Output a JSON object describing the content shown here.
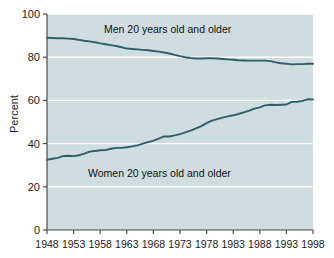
{
  "chart_data": {
    "type": "line",
    "title": "",
    "subtitle": "",
    "xlabel": "",
    "ylabel": "Percent",
    "xlim": [
      1948,
      1998
    ],
    "ylim": [
      0,
      100
    ],
    "grid": true,
    "grid_color": "#ffffff",
    "plot_background": "#cfdde0",
    "line_color": "#2d5f6b",
    "legend_position": "inline-annotation",
    "xticks": [
      1948,
      1953,
      1958,
      1963,
      1968,
      1973,
      1978,
      1983,
      1988,
      1993,
      1998
    ],
    "xtick_labels": [
      "1948",
      "1953",
      "1958",
      "1963",
      "1968",
      "1973",
      "1978",
      "1983",
      "1988",
      "1993",
      "1998"
    ],
    "yticks": [
      0,
      20,
      40,
      60,
      80,
      100
    ],
    "ytick_labels": [
      "0",
      "20",
      "40",
      "60",
      "80",
      "100"
    ],
    "x": [
      1948,
      1949,
      1950,
      1951,
      1952,
      1953,
      1954,
      1955,
      1956,
      1957,
      1958,
      1959,
      1960,
      1961,
      1962,
      1963,
      1964,
      1965,
      1966,
      1967,
      1968,
      1969,
      1970,
      1971,
      1972,
      1973,
      1974,
      1975,
      1976,
      1977,
      1978,
      1979,
      1980,
      1981,
      1982,
      1983,
      1984,
      1985,
      1986,
      1987,
      1988,
      1989,
      1990,
      1991,
      1992,
      1993,
      1994,
      1995,
      1996,
      1997,
      1998
    ],
    "series": [
      {
        "name": "Men 20 years old and older",
        "annotation": "Men 20 years old and older",
        "color": "#2d5f6b",
        "values": [
          89.0,
          88.9,
          88.8,
          88.8,
          88.6,
          88.4,
          88.0,
          87.6,
          87.3,
          86.9,
          86.4,
          86.0,
          85.6,
          85.2,
          84.6,
          84.0,
          83.8,
          83.6,
          83.4,
          83.2,
          82.9,
          82.6,
          82.2,
          81.7,
          81.1,
          80.5,
          80.0,
          79.6,
          79.4,
          79.4,
          79.5,
          79.5,
          79.4,
          79.2,
          79.0,
          78.8,
          78.6,
          78.5,
          78.4,
          78.4,
          78.4,
          78.4,
          78.2,
          77.6,
          77.2,
          77.0,
          76.7,
          76.8,
          76.8,
          77.0,
          77.0
        ]
      },
      {
        "name": "Women 20 years old and older",
        "annotation": "Women 20 years old and older",
        "color": "#2d5f6b",
        "values": [
          32.5,
          33.0,
          33.4,
          34.2,
          34.4,
          34.2,
          34.6,
          35.4,
          36.3,
          36.6,
          36.9,
          37.0,
          37.6,
          38.0,
          38.0,
          38.3,
          38.7,
          39.2,
          40.0,
          40.7,
          41.4,
          42.3,
          43.3,
          43.3,
          43.8,
          44.4,
          45.2,
          46.0,
          47.0,
          48.1,
          49.5,
          50.6,
          51.3,
          52.0,
          52.6,
          53.1,
          53.7,
          54.5,
          55.3,
          56.2,
          56.8,
          57.7,
          58.0,
          57.9,
          58.0,
          58.1,
          59.3,
          59.4,
          59.8,
          60.5,
          60.4
        ]
      }
    ]
  }
}
